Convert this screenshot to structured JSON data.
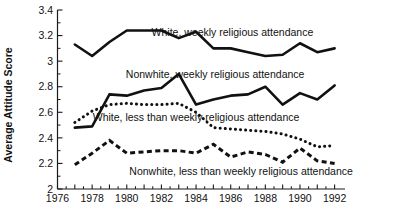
{
  "chart_data": {
    "type": "line",
    "title": "",
    "xlabel": "",
    "ylabel": "Average Attitude Score",
    "xlim": [
      1976,
      1992.6
    ],
    "ylim": [
      2.0,
      3.4
    ],
    "grid": false,
    "legend": "inline-annotations",
    "x_ticks_major": [
      1976,
      1978,
      1980,
      1982,
      1984,
      1986,
      1988,
      1990,
      1992
    ],
    "x_tick_labels": [
      "1976",
      "1978",
      "1980",
      "1982",
      "1984",
      "1986",
      "1988",
      "1990",
      "1992"
    ],
    "x_ticks_minor_step": 0.5,
    "y_ticks": [
      2,
      2.2,
      2.4,
      2.6,
      2.8,
      3,
      3.2,
      3.4
    ],
    "y_tick_labels": [
      "2",
      "2.2",
      "2.4",
      "2.6",
      "2.8",
      "3",
      "3.2",
      "3.4"
    ],
    "x": [
      1977,
      1978,
      1979,
      1980,
      1981,
      1982,
      1983,
      1984,
      1985,
      1986,
      1987,
      1988,
      1989,
      1990,
      1991,
      1992
    ],
    "series": [
      {
        "name": "White, weekly religious attendance",
        "style": "solid",
        "label": "White, weekly religious attendance",
        "label_x": 1986.1,
        "label_y": 3.2,
        "values": [
          3.13,
          3.04,
          3.15,
          3.24,
          3.24,
          3.24,
          3.18,
          3.23,
          3.1,
          3.1,
          3.07,
          3.04,
          3.05,
          3.14,
          3.07,
          3.1
        ]
      },
      {
        "name": "Nonwhite, weekly religious attendance",
        "style": "solid",
        "label": "Nonwhite, weekly religious attendance",
        "label_x": 1985.1,
        "label_y": 2.87,
        "values": [
          2.48,
          2.49,
          2.74,
          2.73,
          2.77,
          2.79,
          2.9,
          2.66,
          2.7,
          2.73,
          2.74,
          2.8,
          2.66,
          2.75,
          2.7,
          2.81
        ]
      },
      {
        "name": "White, less than weekly religious attendance",
        "style": "dotted",
        "label": "White, less than weekly religious attendance",
        "label_x": 1984.0,
        "label_y": 2.53,
        "values": [
          2.52,
          2.61,
          2.66,
          2.67,
          2.66,
          2.66,
          2.67,
          2.6,
          2.48,
          2.47,
          2.46,
          2.45,
          2.43,
          2.39,
          2.33,
          2.34
        ]
      },
      {
        "name": "Nonwhite, less than weekly religious attendance",
        "style": "dashed",
        "label": "Nonwhite, less than weekly religious attendance",
        "label_x": 1986.6,
        "label_y": 2.11,
        "values": [
          2.19,
          2.28,
          2.38,
          2.28,
          2.29,
          2.3,
          2.3,
          2.28,
          2.35,
          2.25,
          2.29,
          2.27,
          2.21,
          2.32,
          2.22,
          2.2
        ]
      }
    ],
    "colors": {
      "ink": "#111111",
      "background": "#ffffff"
    }
  }
}
